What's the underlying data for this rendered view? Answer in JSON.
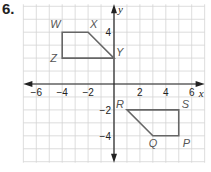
{
  "problem_number": "6.",
  "chart_data": {
    "type": "scatter",
    "title": "",
    "xlabel": "x",
    "ylabel": "y",
    "xlim": [
      -7,
      7
    ],
    "ylim": [
      -6,
      6
    ],
    "grid": true,
    "x_ticks": [
      -6,
      -4,
      -2,
      2,
      4,
      6
    ],
    "y_ticks": [
      4,
      -2,
      -4
    ],
    "x_tick_labels": [
      "−6",
      "−4",
      "−2",
      "2",
      "4",
      "6"
    ],
    "y_tick_labels": [
      "4",
      "−2",
      "−4"
    ],
    "polygons": [
      {
        "name": "WXYZ",
        "vertices": [
          {
            "label": "W",
            "x": -4,
            "y": 4
          },
          {
            "label": "X",
            "x": -2,
            "y": 4
          },
          {
            "label": "Y",
            "x": 0,
            "y": 2
          },
          {
            "label": "Z",
            "x": -4,
            "y": 2
          }
        ]
      },
      {
        "name": "PQRS",
        "vertices": [
          {
            "label": "R",
            "x": 1,
            "y": -2
          },
          {
            "label": "S",
            "x": 5,
            "y": -2
          },
          {
            "label": "P",
            "x": 5,
            "y": -4
          },
          {
            "label": "Q",
            "x": 3,
            "y": -4
          }
        ]
      }
    ]
  },
  "colors": {
    "grid": "#d4d4d4",
    "axis": "#222222",
    "polygon": "#666666"
  }
}
